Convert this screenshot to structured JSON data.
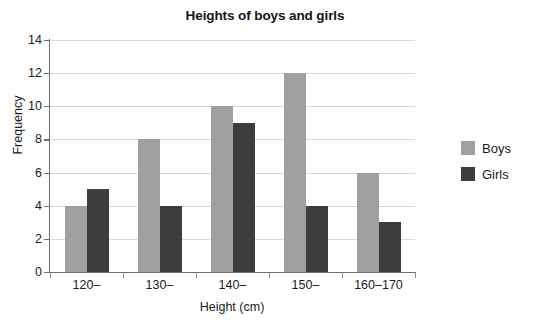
{
  "chart_data": {
    "type": "bar",
    "title": "Heights of boys and girls",
    "xlabel": "Height (cm)",
    "ylabel": "Frequency",
    "categories": [
      "120–",
      "130–",
      "140–",
      "150–",
      "160–170"
    ],
    "series": [
      {
        "name": "Boys",
        "color": "#a0a0a0",
        "values": [
          4,
          8,
          10,
          12,
          6
        ]
      },
      {
        "name": "Girls",
        "color": "#3d3d3d",
        "values": [
          5,
          4,
          9,
          4,
          3
        ]
      }
    ],
    "ylim": [
      0,
      14
    ],
    "ytick_values": [
      0,
      2,
      4,
      6,
      8,
      10,
      12,
      14
    ],
    "ytick_labels": [
      "0",
      "2",
      "4",
      "6",
      "8",
      "10",
      "12",
      "14"
    ],
    "grid": "horizontal",
    "legend_position": "right",
    "bar_grouping": "grouped",
    "background_color": "#ffffff",
    "gridline_color": "#d9d9d9",
    "axis_color": "#6e6e6e"
  }
}
